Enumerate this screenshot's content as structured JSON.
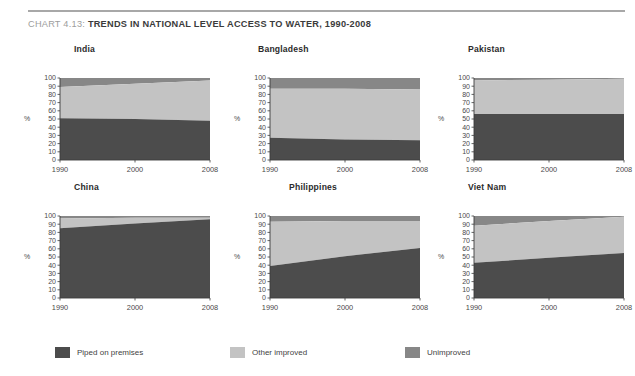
{
  "header": {
    "chart_number": "CHART 4.13:",
    "title": "TRENDS IN NATIONAL LEVEL ACCESS TO WATER, 1990-2008"
  },
  "colors": {
    "piped": "#4c4c4c",
    "other_improved": "#c3c3c3",
    "unimproved": "#878787",
    "axis": "#3c3c3c",
    "title_number": "#9d9d9d",
    "title_main": "#3b3b3b",
    "rule": "#a8a8a8"
  },
  "axis": {
    "y_label": "%",
    "y_ticks": [
      "100",
      "90",
      "80",
      "70",
      "60",
      "50",
      "40",
      "30",
      "20",
      "10",
      "0"
    ],
    "y_min": 0,
    "y_max": 100,
    "x_ticks": [
      "1990",
      "2000",
      "2008"
    ],
    "x_values": [
      1990,
      2000,
      2008
    ]
  },
  "legend": {
    "position": "bottom",
    "items": [
      {
        "label": "Piped on premises",
        "color": "#4c4c4c"
      },
      {
        "label": "Other improved",
        "color": "#c3c3c3"
      },
      {
        "label": "Unimproved",
        "color": "#878787"
      }
    ]
  },
  "chart_data": {
    "type": "area",
    "title": "TRENDS IN NATIONAL LEVEL ACCESS TO WATER, 1990-2008",
    "xlabel": "",
    "ylabel": "%",
    "ylim": [
      0,
      100
    ],
    "xlim": [
      1990,
      2008
    ],
    "grid": false,
    "stacked": true,
    "x": [
      1990,
      2000,
      2008
    ],
    "series_names": [
      "Piped on premises",
      "Other improved",
      "Unimproved"
    ],
    "panels": [
      {
        "name": "India",
        "series": [
          {
            "name": "Piped on premises",
            "values": [
              51,
              50,
              48
            ]
          },
          {
            "name": "Other improved",
            "values": [
              38,
              43,
              49
            ]
          },
          {
            "name": "Unimproved",
            "values": [
              11,
              7,
              3
            ]
          }
        ],
        "cumulative": {
          "piped_top": [
            51,
            50,
            48
          ],
          "improved_top": [
            89,
            93,
            97
          ]
        }
      },
      {
        "name": "Bangladesh",
        "series": [
          {
            "name": "Piped on premises",
            "values": [
              27,
              25,
              24
            ]
          },
          {
            "name": "Other improved",
            "values": [
              60,
              62,
              62
            ]
          },
          {
            "name": "Unimproved",
            "values": [
              13,
              13,
              14
            ]
          }
        ],
        "cumulative": {
          "piped_top": [
            27,
            25,
            24
          ],
          "improved_top": [
            87,
            87,
            86
          ]
        }
      },
      {
        "name": "Pakistan",
        "series": [
          {
            "name": "Piped on premises",
            "values": [
              56,
              56,
              56
            ]
          },
          {
            "name": "Other improved",
            "values": [
              41,
              42,
              43
            ]
          },
          {
            "name": "Unimproved",
            "values": [
              3,
              2,
              1
            ]
          }
        ],
        "cumulative": {
          "piped_top": [
            56,
            56,
            56
          ],
          "improved_top": [
            97,
            98,
            99
          ]
        }
      },
      {
        "name": "China",
        "series": [
          {
            "name": "Piped on premises",
            "values": [
              85,
              91,
              96
            ]
          },
          {
            "name": "Other improved",
            "values": [
              12,
              7,
              2
            ]
          },
          {
            "name": "Unimproved",
            "values": [
              3,
              2,
              2
            ]
          }
        ],
        "cumulative": {
          "piped_top": [
            85,
            91,
            96
          ],
          "improved_top": [
            97,
            98,
            98
          ]
        }
      },
      {
        "name": "Philippines",
        "series": [
          {
            "name": "Piped on premises",
            "values": [
              39,
              51,
              61
            ]
          },
          {
            "name": "Other improved",
            "values": [
              54,
              43,
              33
            ]
          },
          {
            "name": "Unimproved",
            "values": [
              7,
              6,
              6
            ]
          }
        ],
        "cumulative": {
          "piped_top": [
            39,
            51,
            61
          ],
          "improved_top": [
            93,
            94,
            94
          ]
        }
      },
      {
        "name": "Viet Nam",
        "series": [
          {
            "name": "Piped on premises",
            "values": [
              43,
              49,
              55
            ]
          },
          {
            "name": "Other improved",
            "values": [
              45,
              45,
              44
            ]
          },
          {
            "name": "Unimproved",
            "values": [
              12,
              6,
              1
            ]
          }
        ],
        "cumulative": {
          "piped_top": [
            43,
            49,
            55
          ],
          "improved_top": [
            88,
            94,
            99
          ]
        }
      }
    ]
  }
}
